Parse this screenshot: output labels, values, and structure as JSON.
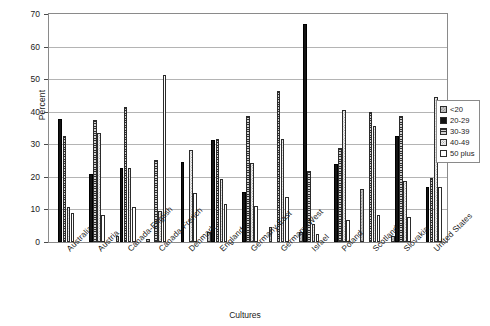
{
  "chart_data": {
    "type": "bar",
    "title": "",
    "xlabel": "Cultures",
    "ylabel": "Percent",
    "ylim": [
      0,
      70
    ],
    "ytick_step": 10,
    "yticks": [
      0,
      10,
      20,
      30,
      40,
      50,
      60,
      70
    ],
    "grid": true,
    "legend_position": "right",
    "categories": [
      "Australia",
      "Austria",
      "Canada-English",
      "Canada-French",
      "Denmark",
      "England",
      "Germany-East",
      "Germany-West",
      "Israel",
      "Poland",
      "Scotland",
      "Slovakia",
      "United States"
    ],
    "series": [
      {
        "name": "<20",
        "values": [
          0.0,
          0.0,
          1.8,
          0.8,
          0.0,
          3.2,
          0.0,
          4.6,
          3.0,
          0.0,
          16.2,
          1.8,
          0.0
        ]
      },
      {
        "name": "20-29",
        "values": [
          37.8,
          20.8,
          22.8,
          0.0,
          24.6,
          31.4,
          15.4,
          0.0,
          66.8,
          23.8,
          0.0,
          32.6,
          16.8
        ]
      },
      {
        "name": "30-39",
        "values": [
          32.4,
          37.4,
          41.6,
          25.2,
          0.0,
          31.6,
          38.6,
          46.4,
          21.8,
          28.8,
          39.8,
          38.6,
          19.8
        ]
      },
      {
        "name": "40-49",
        "values": [
          10.8,
          33.4,
          22.8,
          9.6,
          28.2,
          19.4,
          24.4,
          31.6,
          5.6,
          40.6,
          35.6,
          18.8,
          44.4
        ]
      },
      {
        "name": "50 plus",
        "values": [
          9.0,
          8.4,
          10.8,
          51.4,
          15.2,
          11.6,
          11.2,
          13.8,
          2.4,
          6.8,
          8.2,
          7.8,
          16.8
        ]
      }
    ],
    "series_patterns": [
      "light-checker",
      "solid-black",
      "dark-horizontal-stripe",
      "light-dotted",
      "white-empty"
    ]
  },
  "legend": {
    "items": [
      {
        "label": "<20"
      },
      {
        "label": "20-29"
      },
      {
        "label": "30-39"
      },
      {
        "label": "40-49"
      },
      {
        "label": "50 plus"
      }
    ]
  },
  "colors": {
    "frame": "#8a8a8a",
    "gridline": "#b4b4b4",
    "text": "#1a1a1a",
    "background": "#ffffff"
  }
}
